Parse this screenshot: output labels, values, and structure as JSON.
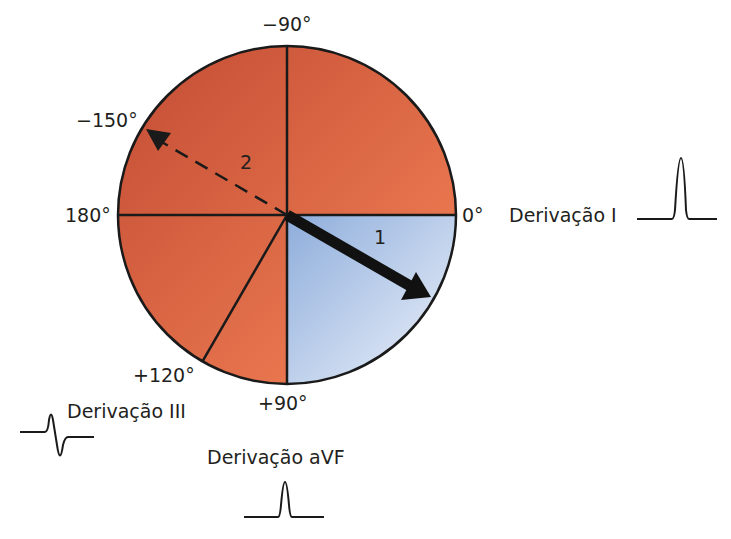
{
  "diagram": {
    "center": {
      "x": 287,
      "y": 215
    },
    "radius": 169,
    "colors": {
      "red_dark": "#c9543a",
      "red_light": "#f07a4e",
      "blue_light": "#e3ecf8",
      "blue_dark": "#95b3dc",
      "stroke": "#1a1a1a"
    },
    "angle_labels": {
      "minus90": "−90°",
      "minus150": "−150°",
      "deg180": "180°",
      "deg0": "0°",
      "plus120": "+120°",
      "plus90": "+90°"
    },
    "vectors": [
      {
        "id": "1",
        "label": "1",
        "angle_deg": 30,
        "style": "solid-thick"
      },
      {
        "id": "2",
        "label": "2",
        "angle_deg": -150,
        "style": "dashed"
      }
    ],
    "leads": [
      {
        "name": "Derivação I",
        "waveform": "positive"
      },
      {
        "name": "Derivação III",
        "waveform": "biphasic"
      },
      {
        "name": "Derivação aVF",
        "waveform": "positive"
      }
    ]
  }
}
